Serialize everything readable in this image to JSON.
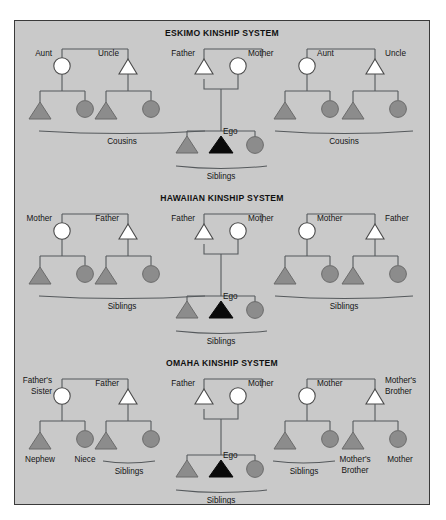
{
  "figure": {
    "background_color": "#c9c9c9",
    "border_color": "#3a3a3a",
    "page_background": "#ffffff",
    "symbol_colors": {
      "open_fill": "#ffffff",
      "grey_fill": "#8c8c8c",
      "ego_fill": "#0a0a0a",
      "line": "#55595c"
    }
  },
  "panels": [
    {
      "id": "eskimo",
      "title": "ESKIMO KINSHIP SYSTEM",
      "parent_labels": [
        "Aunt",
        "Uncle",
        "Father",
        "Mother",
        "Aunt",
        "Uncle"
      ],
      "ego_label": "Ego",
      "group_labels": [
        "Cousins",
        "Siblings",
        "Cousins"
      ],
      "child_labels": []
    },
    {
      "id": "hawaiian",
      "title": "HAWAIIAN KINSHIP SYSTEM",
      "parent_labels": [
        "Mother",
        "Father",
        "Father",
        "Mother",
        "Mother",
        "Father"
      ],
      "ego_label": "Ego",
      "group_labels": [
        "Siblings",
        "Siblings",
        "Siblings"
      ],
      "child_labels": []
    },
    {
      "id": "omaha",
      "title": "OMAHA KINSHIP SYSTEM",
      "parent_labels": [
        "Father's Sister",
        "Father",
        "Father",
        "Mother",
        "Mother",
        "Mother's Brother"
      ],
      "parent_labels_lines": {
        "p1_line1": "Father's",
        "p1_line2": "Sister",
        "p6_line1": "Mother's",
        "p6_line2": "Brother"
      },
      "ego_label": "Ego",
      "group_labels": [
        "Siblings",
        "Siblings",
        "Siblings"
      ],
      "child_labels": {
        "nephew": "Nephew",
        "niece": "Niece",
        "mothers_brother_line1": "Mother's",
        "mothers_brother_line2": "Brother",
        "mother": "Mother"
      }
    }
  ]
}
